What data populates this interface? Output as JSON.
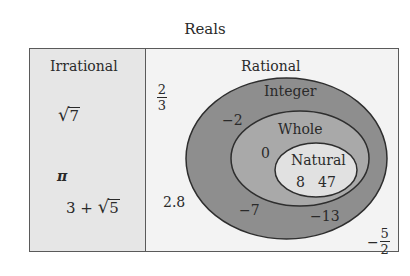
{
  "title": "Reals",
  "panels": {
    "irrational": {
      "heading": "Irrational",
      "examples": [
        {
          "radicand": "7",
          "display": "√7"
        },
        {
          "symbol": "π"
        },
        {
          "prefix": "3 + ",
          "radicand": "5",
          "display": "3 + √5"
        }
      ]
    },
    "rational": {
      "heading": "Rational",
      "examples_outside_integer": [
        {
          "numerator": "2",
          "denominator": "3",
          "display": "2/3"
        },
        {
          "value": "2.8"
        },
        {
          "sign": "−",
          "numerator": "5",
          "denominator": "2",
          "display": "−5/2"
        }
      ]
    }
  },
  "sets": {
    "integer": {
      "label": "Integer",
      "examples": [
        "−2",
        "−7",
        "−13"
      ]
    },
    "whole": {
      "label": "Whole",
      "examples": [
        "0"
      ]
    },
    "natural": {
      "label": "Natural",
      "examples": [
        "8",
        "47"
      ]
    }
  },
  "colors": {
    "border": "#5a5a5a",
    "irrational_bg": "#e6e6e6",
    "rational_bg": "#f3f3f3",
    "integer_fill": "#8e8e8e",
    "whole_fill": "#a9a9a9",
    "natural_fill": "#e1e1e1"
  }
}
